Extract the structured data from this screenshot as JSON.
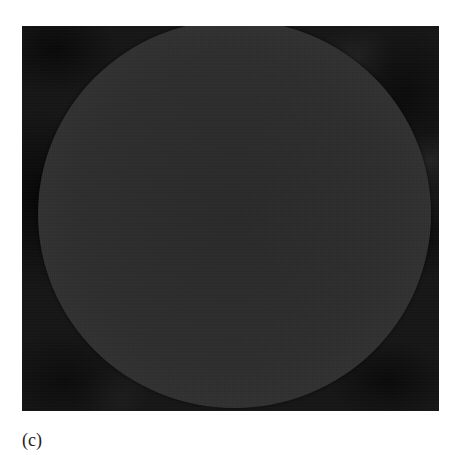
{
  "figure": {
    "panel_label": "(c)",
    "image": {
      "subject": "circular-disc-micrograph",
      "colors": {
        "background": "#151515",
        "disc_center": "#2b2b2b",
        "disc_rim": "#3a3a3a",
        "page": "#ffffff",
        "label_text": "#222222"
      }
    }
  }
}
